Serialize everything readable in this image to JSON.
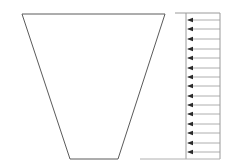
{
  "diagram": {
    "type": "dam-cross-section-with-uniform-pressure",
    "colors": {
      "background": "#ffffff",
      "dam_outline": "#5a5a5a",
      "load_lines": "#9a9a9a",
      "arrowheads": "#2a2a2a",
      "baseline": "#b0b0b0"
    },
    "dam": {
      "shape": "inverted-trapezoid",
      "top_left": [
        22,
        14
      ],
      "top_right": [
        165,
        14
      ],
      "bottom_right": [
        118,
        159
      ],
      "bottom_left": [
        70,
        159
      ]
    },
    "load_diagram": {
      "distribution": "uniform",
      "direction": "left",
      "top_line": {
        "x1": 175,
        "x2": 220,
        "y": 13
      },
      "left_boundary_x": 186,
      "right_boundary_x": 220,
      "top_y": 13,
      "bottom_y": 159,
      "arrow_count": 15,
      "arrow_y": [
        20,
        29,
        39,
        49,
        58,
        68,
        77,
        86,
        96,
        105,
        114,
        124,
        133,
        143,
        152
      ]
    },
    "baseline": {
      "x1": 140,
      "x2": 220,
      "y": 159
    }
  }
}
